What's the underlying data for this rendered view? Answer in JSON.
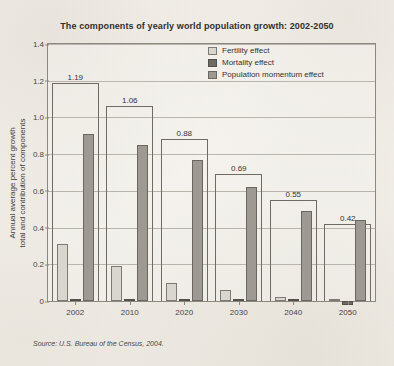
{
  "chart_data": {
    "type": "bar",
    "title": "The components of yearly world population growth: 2002-2050",
    "xlabel": "",
    "ylabel": "Annual average percent growth total and contribution of components",
    "ylabel_lines": [
      "Annual average percent growth",
      "total and contribution of components"
    ],
    "categories": [
      "2002",
      "2010",
      "2020",
      "2030",
      "2040",
      "2050"
    ],
    "ylim": [
      0,
      1.4
    ],
    "yticks": [
      "0",
      "0.2",
      "0.4",
      "0.6",
      "0.8",
      "1.0",
      "1.2",
      "1.4"
    ],
    "ytick_values": [
      0,
      0.2,
      0.4,
      0.6,
      0.8,
      1.0,
      1.2,
      1.4
    ],
    "grid": true,
    "legend_position": "top-right",
    "series": [
      {
        "name": "Fertility effect",
        "color": "#d9d6cf",
        "values": [
          0.31,
          0.19,
          0.1,
          0.06,
          0.02,
          0.005
        ]
      },
      {
        "name": "Mortality effect",
        "color": "#6e6b65",
        "values": [
          0.01,
          0.01,
          0.005,
          0.005,
          0.005,
          -0.02
        ]
      },
      {
        "name": "Population momentum effect",
        "color": "#9e9a93",
        "values": [
          0.91,
          0.85,
          0.77,
          0.62,
          0.49,
          0.44
        ]
      }
    ],
    "totals": {
      "label": "Total growth",
      "values": [
        1.19,
        1.06,
        0.88,
        0.69,
        0.55,
        0.42
      ],
      "labels": [
        "1.19",
        "1.06",
        "0.88",
        "0.69",
        "0.55",
        "0.42"
      ]
    },
    "source": "Source: U.S. Bureau of the Census, 2004."
  }
}
